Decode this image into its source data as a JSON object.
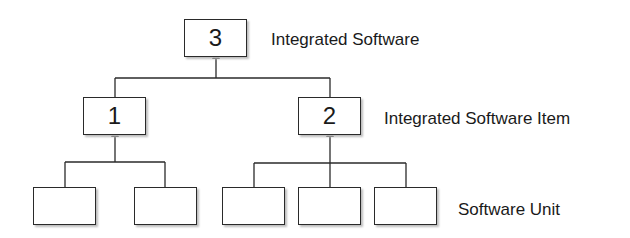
{
  "diagram": {
    "levels": [
      {
        "id": "integrated-software",
        "label": "Integrated Software"
      },
      {
        "id": "integrated-software-item",
        "label": "Integrated Software Item"
      },
      {
        "id": "software-unit",
        "label": "Software Unit"
      }
    ],
    "nodes": [
      {
        "id": "n3",
        "label": "3",
        "level": "integrated-software"
      },
      {
        "id": "n1",
        "label": "1",
        "level": "integrated-software-item",
        "parent": "n3"
      },
      {
        "id": "n2",
        "label": "2",
        "level": "integrated-software-item",
        "parent": "n3"
      },
      {
        "id": "u1",
        "label": "",
        "level": "software-unit",
        "parent": "n1"
      },
      {
        "id": "u2",
        "label": "",
        "level": "software-unit",
        "parent": "n1"
      },
      {
        "id": "u3",
        "label": "",
        "level": "software-unit",
        "parent": "n2"
      },
      {
        "id": "u4",
        "label": "",
        "level": "software-unit",
        "parent": "n2"
      },
      {
        "id": "u5",
        "label": "",
        "level": "software-unit",
        "parent": "n2"
      }
    ],
    "edge_style": "arrow-to-parent",
    "colors": {
      "line": "#2a2a2a",
      "shadow": "#bdbdbd",
      "background": "#ffffff"
    }
  }
}
